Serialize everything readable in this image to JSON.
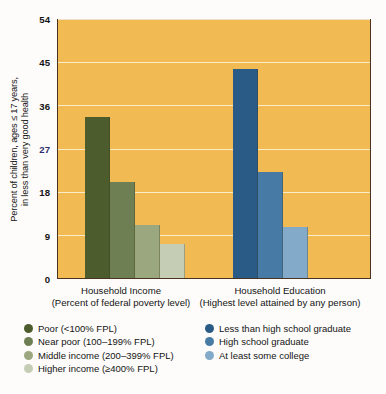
{
  "axis": {
    "ylabel_line1": "Percent of children, ages ≤ 17 years,",
    "ylabel_line2": "in less than very good health",
    "yticks": [
      "54",
      "45",
      "36",
      "27",
      "18",
      "9",
      "0"
    ]
  },
  "groups": {
    "income": {
      "caption": "Household Income",
      "caption_sub": "(Percent of federal poverty level)"
    },
    "education": {
      "caption": "Household Education",
      "caption_sub": "(Highest level attained by any person)"
    }
  },
  "legend_income": {
    "items": [
      {
        "label": "Poor (<100% FPL)",
        "color": "#4c5c2c"
      },
      {
        "label": "Near poor (100–199% FPL)",
        "color": "#6f7f54"
      },
      {
        "label": "Middle income (200–399% FPL)",
        "color": "#9aa77f"
      },
      {
        "label": "Higher income (≥400% FPL)",
        "color": "#c5cdb4"
      }
    ]
  },
  "legend_education": {
    "items": [
      {
        "label": "Less than high school graduate",
        "color": "#2a5b86"
      },
      {
        "label": "High school graduate",
        "color": "#477ba6"
      },
      {
        "label": "At least some college",
        "color": "#84aac9"
      }
    ]
  },
  "colors": {
    "plot_background": "#f2ba52",
    "plot_border": "#4a3420",
    "gridline": "#fbf0d2",
    "page_background": "#fdfcfa"
  },
  "chart_data": {
    "type": "bar",
    "title": "",
    "xlabel": "",
    "ylabel": "Percent of children, ages ≤ 17 years, in less than very good health",
    "ylim": [
      0,
      54
    ],
    "ytick_values": [
      0,
      9,
      18,
      27,
      36,
      45,
      54
    ],
    "grid": true,
    "legend_position": "below-plot",
    "groups": [
      {
        "name": "Household Income",
        "sublabel": "(Percent of federal poverty level)",
        "categories": [
          "Poor (<100% FPL)",
          "Near poor (100–199% FPL)",
          "Middle income (200–399% FPL)",
          "Higher income (≥400% FPL)"
        ],
        "values": [
          33.5,
          20.0,
          11.0,
          7.0
        ],
        "colors": [
          "#4c5c2c",
          "#6f7f54",
          "#9aa77f",
          "#c5cdb4"
        ]
      },
      {
        "name": "Household Education",
        "sublabel": "(Highest level attained by any person)",
        "categories": [
          "Less than high school graduate",
          "High school graduate",
          "At least some college"
        ],
        "values": [
          43.5,
          22.0,
          10.5
        ],
        "colors": [
          "#2a5b86",
          "#477ba6",
          "#84aac9"
        ]
      }
    ]
  }
}
